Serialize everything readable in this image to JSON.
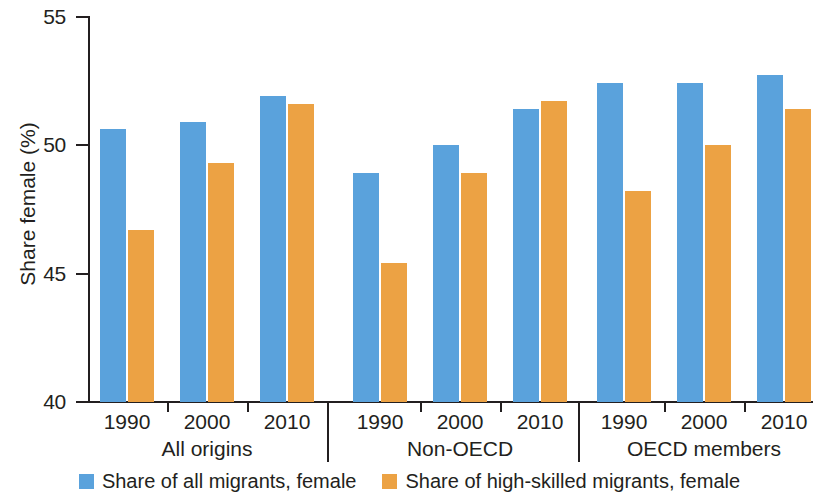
{
  "chart_data": {
    "type": "bar",
    "title": "",
    "xlabel": "",
    "ylabel": "Share female (%)",
    "ylim": [
      40,
      55
    ],
    "yticks": [
      40,
      45,
      50,
      55
    ],
    "ytick_labels": [
      "40",
      "45",
      "50",
      "55"
    ],
    "grid": false,
    "legend_position": "bottom-center",
    "group_labels": [
      "All origins",
      "Non-OECD",
      "OECD members"
    ],
    "categories": [
      "1990",
      "2000",
      "2010",
      "1990",
      "2000",
      "2010",
      "1990",
      "2000",
      "2010"
    ],
    "series": [
      {
        "name": "Share of all migrants, female",
        "color": "#5aa2dc",
        "values": [
          50.6,
          50.9,
          51.9,
          48.9,
          50.0,
          51.4,
          52.4,
          52.4,
          52.7
        ]
      },
      {
        "name": "Share of high-skilled migrants, female",
        "color": "#eca244",
        "values": [
          46.7,
          49.3,
          51.6,
          45.4,
          48.9,
          51.7,
          48.2,
          50.0,
          51.4
        ]
      }
    ],
    "groups": [
      {
        "label": "All origins",
        "years": [
          "1990",
          "2000",
          "2010"
        ],
        "all_migrants_female": [
          50.6,
          50.9,
          51.9
        ],
        "high_skilled_migrants_female": [
          46.7,
          49.3,
          51.6
        ]
      },
      {
        "label": "Non-OECD",
        "years": [
          "1990",
          "2000",
          "2010"
        ],
        "all_migrants_female": [
          48.9,
          50.0,
          51.4
        ],
        "high_skilled_migrants_female": [
          45.4,
          48.9,
          51.7
        ]
      },
      {
        "label": "OECD members",
        "years": [
          "1990",
          "2000",
          "2010"
        ],
        "all_migrants_female": [
          52.4,
          52.4,
          52.7
        ],
        "high_skilled_migrants_female": [
          48.2,
          50.0,
          51.4
        ]
      }
    ]
  },
  "axis": {
    "y_title": "Share female (%)",
    "y_labels": [
      "55",
      "50",
      "45",
      "40"
    ]
  },
  "legend": {
    "items": [
      {
        "label": "Share of all migrants, female",
        "color": "#5aa2dc",
        "swatch": "blue-square-icon"
      },
      {
        "label": "Share of high-skilled migrants, female",
        "color": "#eca244",
        "swatch": "orange-square-icon"
      }
    ]
  },
  "groups": [
    {
      "label": "All origins",
      "years": [
        "1990",
        "2000",
        "2010"
      ]
    },
    {
      "label": "Non-OECD",
      "years": [
        "1990",
        "2000",
        "2010"
      ]
    },
    {
      "label": "OECD members",
      "years": [
        "1990",
        "2000",
        "2010"
      ]
    }
  ]
}
